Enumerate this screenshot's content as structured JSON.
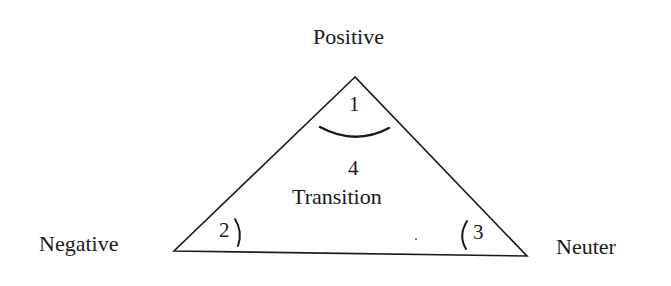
{
  "diagram": {
    "vertices": {
      "top": "Positive",
      "left": "Negative",
      "right": "Neuter"
    },
    "regions": {
      "top_angle": "1",
      "left_angle": "2",
      "right_angle": "3",
      "center_number": "4",
      "center_label": "Transition"
    },
    "colors": {
      "stroke": "#1a1a1a",
      "background": "#ffffff"
    }
  }
}
